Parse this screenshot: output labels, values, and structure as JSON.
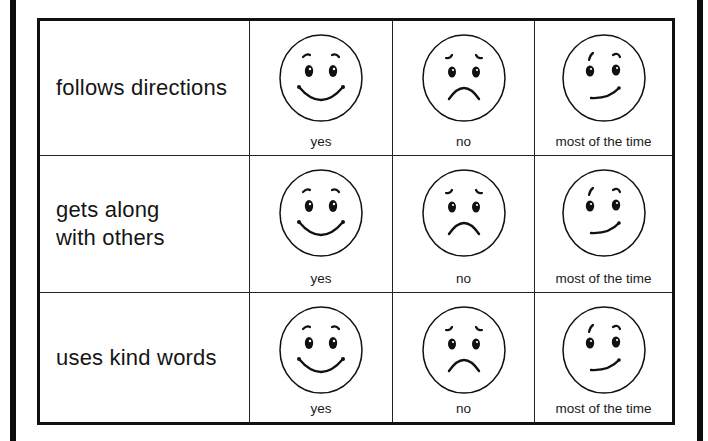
{
  "worksheet": {
    "columns": [
      "behavior",
      "yes",
      "no",
      "most of the time"
    ],
    "rows": [
      {
        "behavior": "follows directions",
        "choices": [
          {
            "face": "happy-face-icon",
            "label": "yes"
          },
          {
            "face": "sad-face-icon",
            "label": "no"
          },
          {
            "face": "smirk-face-icon",
            "label": "most of the time"
          }
        ]
      },
      {
        "behavior": "gets along\nwith others",
        "choices": [
          {
            "face": "happy-face-icon",
            "label": "yes"
          },
          {
            "face": "sad-face-icon",
            "label": "no"
          },
          {
            "face": "smirk-face-icon",
            "label": "most of the time"
          }
        ]
      },
      {
        "behavior": "uses kind words",
        "choices": [
          {
            "face": "happy-face-icon",
            "label": "yes"
          },
          {
            "face": "sad-face-icon",
            "label": "no"
          },
          {
            "face": "smirk-face-icon",
            "label": "most of the time"
          }
        ]
      }
    ]
  },
  "colors": {
    "ink": "#111111",
    "paper": "#ffffff"
  }
}
